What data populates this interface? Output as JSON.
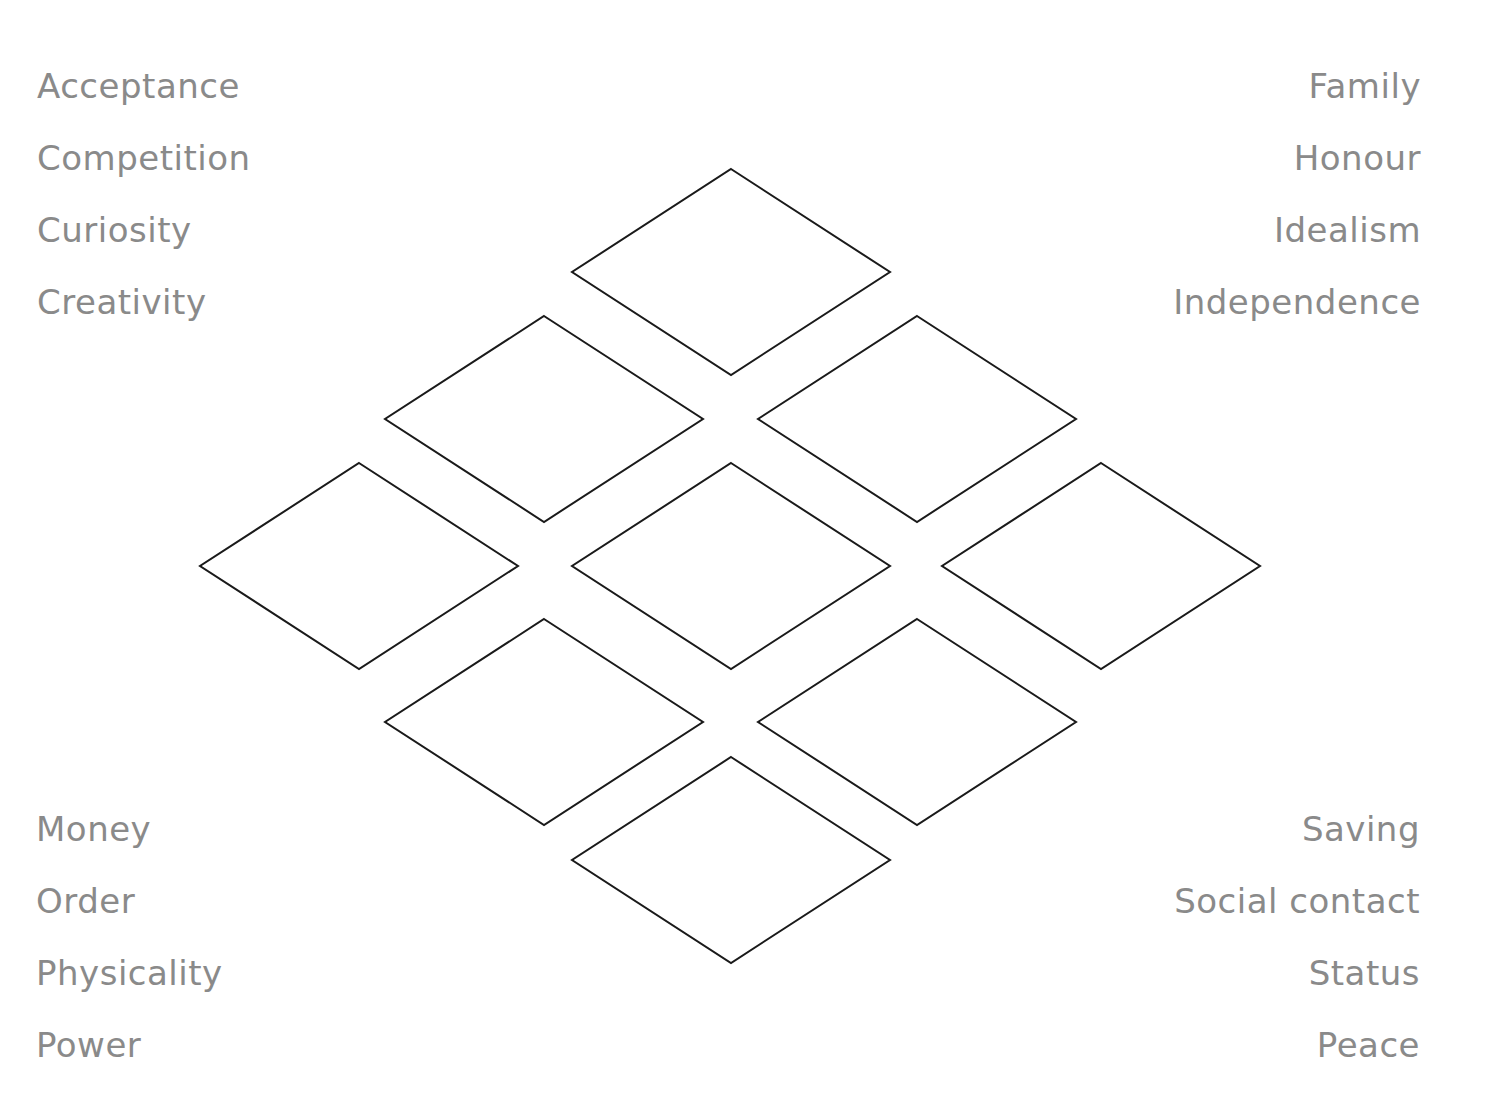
{
  "labels": {
    "top_left": [
      "Acceptance",
      "Competition",
      "Curiosity",
      "Creativity"
    ],
    "top_right": [
      "Family",
      "Honour",
      "Idealism",
      "Independence"
    ],
    "bottom_left": [
      "Money",
      "Order",
      "Physicality",
      "Power"
    ],
    "bottom_right": [
      "Saving",
      "Social contact",
      "Status",
      "Peace"
    ]
  },
  "diamond_grid": {
    "layout": "diamond-of-9 (1-2-3-2-1)",
    "stroke_color": "#1a1a1a",
    "text_color": "#8a8a8a",
    "diamond_size": {
      "width": 318,
      "height": 206
    },
    "diamonds": [
      {
        "row": 1,
        "cx": 731,
        "cy": 272
      },
      {
        "row": 2,
        "cx": 544,
        "cy": 419
      },
      {
        "row": 2,
        "cx": 917,
        "cy": 419
      },
      {
        "row": 3,
        "cx": 359,
        "cy": 566
      },
      {
        "row": 3,
        "cx": 731,
        "cy": 566
      },
      {
        "row": 3,
        "cx": 1101,
        "cy": 566
      },
      {
        "row": 4,
        "cx": 544,
        "cy": 722
      },
      {
        "row": 4,
        "cx": 917,
        "cy": 722
      },
      {
        "row": 5,
        "cx": 731,
        "cy": 860
      }
    ]
  }
}
